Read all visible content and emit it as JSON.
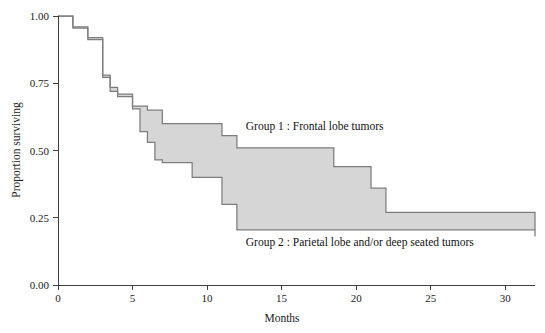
{
  "chart_data": {
    "type": "line",
    "title": "",
    "subtitle": "",
    "xlabel": "Months",
    "ylabel": "Proportion surviving",
    "xlim": [
      0,
      32
    ],
    "ylim": [
      0.0,
      1.0
    ],
    "xticks": [
      0,
      5,
      10,
      15,
      20,
      25,
      30
    ],
    "xtick_labels": [
      "0",
      "5",
      "10",
      "15",
      "20",
      "25",
      "30"
    ],
    "yticks": [
      0.0,
      0.25,
      0.5,
      0.75,
      1.0
    ],
    "ytick_labels": [
      "0.00",
      "0.25",
      "0.50",
      "0.75",
      "1.00"
    ],
    "grid": false,
    "legend_position": "inline-annotation",
    "style": "kaplan-meier-step-curves-with-shaded-band",
    "band_fill_color": "#d6d6d6",
    "line_color": "#7d7d7d",
    "axis_color": "#2b2b2b",
    "series": [
      {
        "name": "Group 1 : Frontal lobe tumors",
        "step": "post",
        "x": [
          0,
          1,
          2,
          3,
          3.5,
          4,
          5,
          6,
          7,
          11,
          12,
          17.8,
          18.5,
          21,
          22,
          32
        ],
        "values": [
          1.0,
          0.96,
          0.92,
          0.78,
          0.735,
          0.71,
          0.665,
          0.65,
          0.6,
          0.555,
          0.51,
          0.51,
          0.44,
          0.36,
          0.27,
          0.18
        ]
      },
      {
        "name": "Group 2 : Parietal lobe and/or deep seated tumors",
        "step": "post",
        "x": [
          0,
          1,
          2,
          3,
          3.5,
          4,
          5,
          5.5,
          6,
          6.5,
          7,
          9,
          11,
          12,
          32
        ],
        "values": [
          1.0,
          0.955,
          0.912,
          0.772,
          0.72,
          0.7,
          0.655,
          0.57,
          0.53,
          0.465,
          0.455,
          0.4,
          0.3,
          0.205,
          0.205
        ]
      }
    ],
    "annotations": [
      {
        "name": "group-1-label",
        "text": "Group 1 : Frontal lobe tumors",
        "x": 12.6,
        "y": 0.575
      },
      {
        "name": "group-2-label",
        "text": "Group 2 : Parietal lobe and/or deep seated tumors",
        "x": 12.6,
        "y": 0.145
      }
    ]
  }
}
